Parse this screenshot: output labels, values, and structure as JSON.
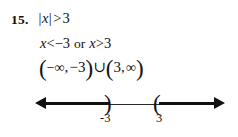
{
  "problem": {
    "number_label": "15.",
    "inequality": {
      "abs_open": "|",
      "variable": "x",
      "abs_close": "|",
      "relation": ">",
      "value": "3"
    },
    "solution": {
      "left_variable": "x",
      "left_relation": "<",
      "left_value": "−3",
      "conjunction": "or",
      "right_variable": "x",
      "right_relation": ">",
      "right_value": "3"
    },
    "interval_notation": {
      "open_paren_1": "(",
      "neg_infinity": "−∞",
      "comma_1": ",",
      "left_bound": "−3",
      "close_paren_1": ")",
      "union": "∪",
      "open_paren_2": "(",
      "right_bound": "3",
      "comma_2": ",",
      "pos_infinity": "∞",
      "close_paren_2": ")"
    }
  },
  "number_line": {
    "left_arrow_icon": "left-arrow-icon",
    "right_arrow_icon": "right-arrow-icon",
    "left_endpoint_bracket": ")",
    "right_endpoint_bracket": "(",
    "tick_labels": [
      "-3",
      "3"
    ],
    "axis_color": "#111111",
    "label_color": "#151515"
  }
}
